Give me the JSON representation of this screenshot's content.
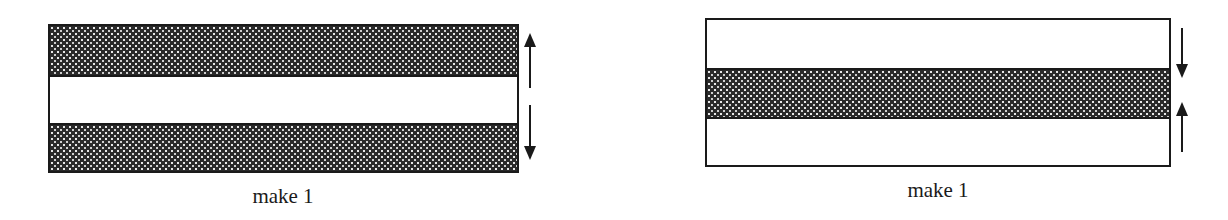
{
  "panels": [
    {
      "id": "left",
      "caption": "make 1",
      "description": "two shaded bands at top and bottom, white gap in middle, arrows pointing outward (up and down)",
      "arrows": [
        "up",
        "down"
      ]
    },
    {
      "id": "right",
      "caption": "make 1",
      "description": "single shaded band in middle, white regions above and below, arrows pointing inward (down and up)",
      "arrows": [
        "down",
        "up"
      ]
    }
  ],
  "colors": {
    "line": "#1a1a1a",
    "fill_dark": "#2a2a2a",
    "fill_dot": "#e8e8e8",
    "background": "#ffffff"
  }
}
